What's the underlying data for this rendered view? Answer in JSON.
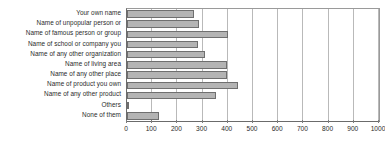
{
  "chart_data": {
    "type": "bar",
    "orientation": "horizontal",
    "title": "",
    "subtitle": "",
    "xlabel": "",
    "ylabel": "",
    "xlim": [
      0,
      1000
    ],
    "xticks": [
      0,
      100,
      200,
      300,
      400,
      500,
      600,
      700,
      800,
      900,
      1000
    ],
    "grid": true,
    "legend": false,
    "legend_position": "none",
    "bar_color": "#b4b4b4",
    "bar_border_color": "#6f6f6f",
    "gridline_color": "#b9b9b9",
    "axis_color": "#6b6b6b",
    "categories": [
      "Your own name",
      "Name of unpopular person or",
      "Name of famous person or group",
      "Name of school or company you",
      "Name of any other organization",
      "Name of living area",
      "Name of any other place",
      "Name of product you own",
      "Name of any other product",
      "Others",
      "None of them"
    ],
    "values": [
      265,
      285,
      400,
      280,
      310,
      395,
      395,
      440,
      355,
      5,
      125
    ]
  }
}
